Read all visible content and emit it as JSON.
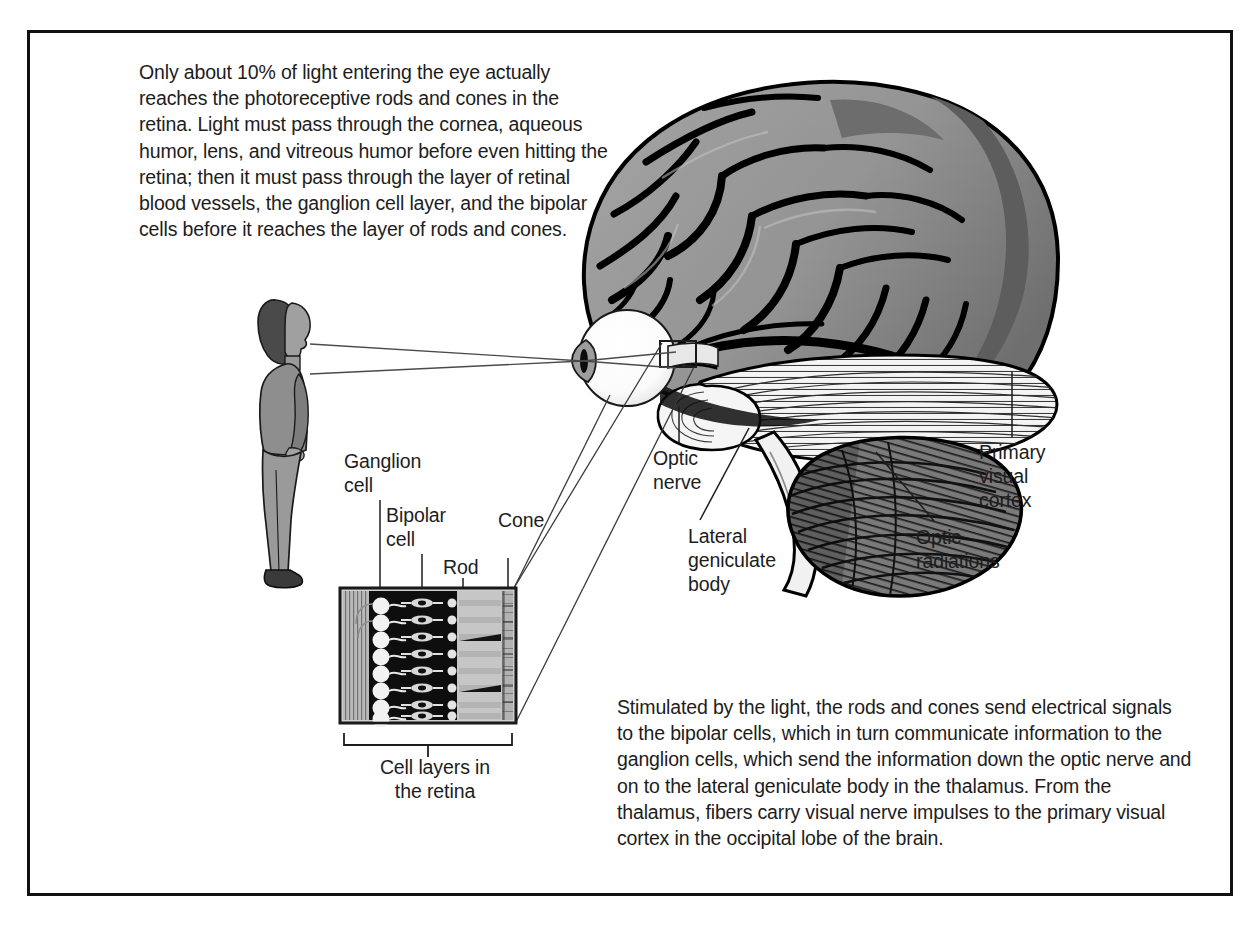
{
  "figure": {
    "frame_color": "#111111",
    "background": "#ffffff"
  },
  "text_blocks": {
    "intro": "Only about 10% of light entering the eye actually reaches the photoreceptive rods and cones in the retina. Light must pass through the cornea, aqueous humor, lens, and vitreous humor before even hitting the retina; then it must pass through the layer of retinal blood vessels, the ganglion cell layer, and the bipolar cells before it reaches the layer of rods and cones.",
    "summary": "Stimulated by the light, the rods and cones send electrical signals to the bipolar cells, which in turn communicate information to the ganglion cells, which send the information down the optic nerve and on to the lateral geniculate body in the thalamus. From the thalamus, fibers carry visual nerve impulses to the primary visual cortex in the occipital lobe of the brain."
  },
  "retina_inset": {
    "caption": "Cell layers in\nthe retina",
    "labels": {
      "ganglion_cell": "Ganglion\ncell",
      "bipolar_cell": "Bipolar\ncell",
      "rod": "Rod",
      "cone": "Cone"
    },
    "layers": [
      "retinal blood vessels",
      "ganglion cell layer",
      "bipolar cell layer",
      "rods and cones layer",
      "pigment epithelium"
    ],
    "cell_rows": 8
  },
  "anatomy_labels": {
    "optic_nerve": "Optic\nnerve",
    "lateral_geniculate_body": "Lateral\ngeniculate\nbody",
    "optic_radiations": "Optic\nradiations",
    "primary_visual_cortex": "Primary\nvisual\ncortex"
  },
  "colors": {
    "ink": "#1d1d1d",
    "outline": "#000000",
    "brain_light": "#9d9d9d",
    "brain_mid": "#7e7e7e",
    "brain_dark": "#545454",
    "brain_shadow": "#0d0d0d",
    "cerebellum": "#6e6e6e",
    "optic_radiation_fill": "#f2f2f2",
    "person_skin": "#9a9a9a",
    "person_clothes": "#8e8e8e",
    "person_hair": "#4a4a4a",
    "eye_white": "#fdfdfd",
    "retina_box_band_light": "#c9c9c9",
    "retina_box_band_dark": "#131313",
    "leader_line": "#3a3a3a"
  },
  "figure_elements": {
    "person": "standing woman in profile facing right",
    "eye": "eyeball with lens and pupil",
    "brain": "lateral view of human brain with cerebellum and brainstem",
    "light_rays": "three light ray lines from person to eye lens",
    "magnifier_leaders": "two leader lines from retina box to magnified cell-layer inset"
  }
}
